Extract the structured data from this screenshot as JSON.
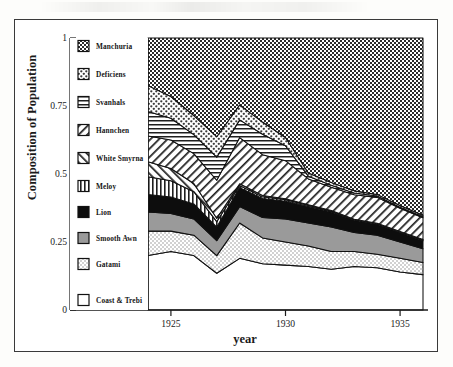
{
  "chart_data": {
    "type": "area",
    "stacked": true,
    "title": "",
    "xlabel": "year",
    "ylabel": "Composition of Population",
    "xlim": [
      1924,
      1936
    ],
    "ylim": [
      0,
      1
    ],
    "xticks": [
      1925,
      1930,
      1935
    ],
    "xtick_labels": [
      "1925",
      "1930",
      "1935"
    ],
    "yticks": [
      0,
      0.25,
      0.5,
      0.75,
      1
    ],
    "ytick_labels": [
      "0",
      "0.25",
      "0.5",
      "0.75",
      "1"
    ],
    "grid": false,
    "legend_position": "inside-left",
    "x": [
      1924,
      1925,
      1926,
      1927,
      1928,
      1929,
      1930,
      1931,
      1932,
      1933,
      1934,
      1935,
      1936
    ],
    "series": [
      {
        "name": "Coast & Trebi",
        "pattern": "solid-white",
        "values": [
          0.2,
          0.215,
          0.2,
          0.135,
          0.19,
          0.17,
          0.165,
          0.16,
          0.15,
          0.16,
          0.155,
          0.14,
          0.13
        ]
      },
      {
        "name": "Gatami",
        "pattern": "fine-dot",
        "values": [
          0.09,
          0.075,
          0.075,
          0.065,
          0.13,
          0.095,
          0.085,
          0.075,
          0.065,
          0.055,
          0.05,
          0.05,
          0.045
        ]
      },
      {
        "name": "Smooth Awn",
        "pattern": "solid-grey",
        "values": [
          0.07,
          0.065,
          0.06,
          0.055,
          0.06,
          0.075,
          0.085,
          0.085,
          0.09,
          0.07,
          0.07,
          0.06,
          0.05
        ]
      },
      {
        "name": "Lion",
        "pattern": "solid-black",
        "values": [
          0.065,
          0.06,
          0.055,
          0.05,
          0.07,
          0.07,
          0.065,
          0.06,
          0.055,
          0.045,
          0.04,
          0.035,
          0.03
        ]
      },
      {
        "name": "Meloy",
        "pattern": "vertical-lines",
        "values": [
          0.065,
          0.06,
          0.045,
          0.02,
          0.008,
          0.006,
          0.005,
          0.004,
          0.003,
          0.002,
          0.002,
          0.002,
          0.002
        ]
      },
      {
        "name": "White Smyrna",
        "pattern": "back-hatch",
        "values": [
          0.055,
          0.045,
          0.03,
          0.012,
          0.006,
          0.005,
          0.004,
          0.003,
          0.003,
          0.002,
          0.002,
          0.002,
          0.002
        ]
      },
      {
        "name": "Hannchen",
        "pattern": "fwd-hatch",
        "values": [
          0.095,
          0.105,
          0.11,
          0.14,
          0.17,
          0.15,
          0.14,
          0.095,
          0.085,
          0.09,
          0.095,
          0.085,
          0.08
        ]
      },
      {
        "name": "Svanhals",
        "pattern": "horizontal-lines",
        "values": [
          0.09,
          0.08,
          0.07,
          0.085,
          0.065,
          0.075,
          0.055,
          0.01,
          0.008,
          0.006,
          0.005,
          0.004,
          0.004
        ]
      },
      {
        "name": "Deficiens",
        "pattern": "coarse-dot",
        "values": [
          0.095,
          0.08,
          0.07,
          0.075,
          0.055,
          0.045,
          0.03,
          0.012,
          0.01,
          0.008,
          0.006,
          0.006,
          0.005
        ]
      },
      {
        "name": "Manchuria",
        "pattern": "cross-weave",
        "values": [
          0.175,
          0.215,
          0.285,
          0.363,
          0.246,
          0.309,
          0.366,
          0.496,
          0.531,
          0.562,
          0.575,
          0.616,
          0.652
        ]
      }
    ],
    "legend_entries": [
      {
        "label": "Manchuria",
        "pattern": "cross-weave"
      },
      {
        "label": "Deficiens",
        "pattern": "coarse-dot"
      },
      {
        "label": "Svanhals",
        "pattern": "horizontal-lines"
      },
      {
        "label": "Hannchen",
        "pattern": "fwd-hatch"
      },
      {
        "label": "White Smyrna",
        "pattern": "back-hatch"
      },
      {
        "label": "Meloy",
        "pattern": "vertical-lines"
      },
      {
        "label": "Lion",
        "pattern": "solid-black"
      },
      {
        "label": "Smooth Awn",
        "pattern": "solid-grey"
      },
      {
        "label": "Gatami",
        "pattern": "fine-dot"
      },
      {
        "label": "Coast & Trebi",
        "pattern": "solid-white"
      }
    ],
    "colors": {
      "ink": "#1a1a1a",
      "grey_fill": "#9a9a9a",
      "light_grey_fill": "#cfcfcf",
      "black_fill": "#0d0d0d",
      "white_fill": "#ffffff",
      "frame": "#3a3a3a"
    }
  }
}
